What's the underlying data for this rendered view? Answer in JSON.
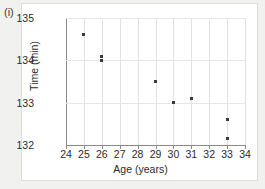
{
  "figure": {
    "label": "(i)"
  },
  "chart_data": {
    "type": "scatter",
    "title": "",
    "xlabel": "Age (years)",
    "ylabel": "Time (min)",
    "xlim": [
      24,
      34
    ],
    "ylim": [
      132,
      135
    ],
    "xticks": [
      24,
      25,
      26,
      27,
      28,
      29,
      30,
      31,
      32,
      33,
      34
    ],
    "xticklabels": [
      "24",
      "25",
      "26",
      "27",
      "28",
      "29",
      "30",
      "31",
      "32",
      "33",
      "34"
    ],
    "yticks": [
      132,
      133,
      134,
      135
    ],
    "yticklabels": [
      "132",
      "133",
      "134",
      "135"
    ],
    "grid": true,
    "grid_axis": "both",
    "legend": null,
    "marker": "square",
    "marker_color": "#3a3a3a",
    "points": [
      {
        "x": 25,
        "y": 134.6
      },
      {
        "x": 26,
        "y": 134.1
      },
      {
        "x": 26,
        "y": 134.0
      },
      {
        "x": 29,
        "y": 133.5
      },
      {
        "x": 30,
        "y": 133.0
      },
      {
        "x": 31,
        "y": 133.1
      },
      {
        "x": 33,
        "y": 132.6
      },
      {
        "x": 33,
        "y": 132.15
      }
    ],
    "series": [
      {
        "name": "Age vs Time",
        "x": [
          25,
          26,
          26,
          29,
          30,
          31,
          33,
          33
        ],
        "values": [
          134.6,
          134.1,
          134.0,
          133.5,
          133.0,
          133.1,
          132.6,
          132.15
        ]
      }
    ]
  }
}
